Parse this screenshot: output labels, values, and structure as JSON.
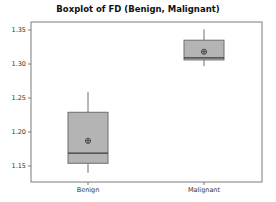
{
  "chart_data": {
    "type": "boxplot",
    "title": "Boxplot of FD (Benign, Malignant)",
    "xlabel": "",
    "ylabel": "",
    "categories": [
      "Benign",
      "Malignant"
    ],
    "ylim": [
      1.13,
      1.36
    ],
    "yticks": [
      1.15,
      1.2,
      1.25,
      1.3,
      1.35
    ],
    "ytick_labels": [
      "1.15",
      "1.20",
      "1.25",
      "1.30",
      "1.35"
    ],
    "grid": false,
    "legend": null,
    "series": [
      {
        "name": "Benign",
        "whisker_low": 1.14,
        "q1": 1.154,
        "median": 1.169,
        "q3": 1.229,
        "whisker_high": 1.259,
        "mean": 1.187
      },
      {
        "name": "Malignant",
        "whisker_low": 1.297,
        "q1": 1.306,
        "median": 1.309,
        "q3": 1.335,
        "whisker_high": 1.351,
        "mean": 1.318
      }
    ],
    "colors": {
      "box_fill": "#b4b4b4",
      "box_edge": "#6e6e6e",
      "median": "#3a3a3a",
      "whisker": "#6e6e6e",
      "axis": "#7a7a7a"
    }
  }
}
